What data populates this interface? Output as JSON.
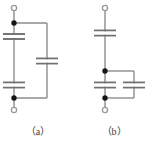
{
  "figure": {
    "type": "circuit-diagram",
    "background_color": "#ffffff",
    "wire_color": "#808080",
    "plate_color": "#7a7a7a",
    "node_color": "#151515",
    "terminal_stroke_color": "#9a9a9a",
    "label_color": "#3b3b3b",
    "panels": [
      {
        "id": "a",
        "caption": "（a）",
        "terminals": [
          {
            "name": "top-terminal",
            "shape": "open-circle",
            "x": 14,
            "y": 8
          },
          {
            "name": "bottom-terminal",
            "shape": "open-circle",
            "x": 14,
            "y": 110
          }
        ],
        "nodes": [
          {
            "name": "top-node",
            "shape": "filled-dot",
            "x": 14,
            "y": 23
          },
          {
            "name": "bottom-node",
            "shape": "filled-dot",
            "x": 14,
            "y": 98
          }
        ],
        "capacitors": [
          {
            "name": "capacitor-top-left",
            "orientation": "horizontal-plates",
            "cx": 14,
            "cy": 36
          },
          {
            "name": "capacitor-bottom-left",
            "orientation": "horizontal-plates",
            "cx": 14,
            "cy": 85
          },
          {
            "name": "capacitor-right-branch",
            "orientation": "horizontal-plates",
            "cx": 47,
            "cy": 61
          }
        ],
        "wires": [
          {
            "name": "wire-top-lead",
            "x1": 14,
            "y1": 8,
            "x2": 14,
            "y2": 23
          },
          {
            "name": "wire-left-rail",
            "x1": 14,
            "y1": 23,
            "x2": 14,
            "y2": 98
          },
          {
            "name": "wire-bottom-lead",
            "x1": 14,
            "y1": 98,
            "x2": 14,
            "y2": 110
          },
          {
            "name": "wire-top-branch",
            "x1": 14,
            "y1": 23,
            "x2": 47,
            "y2": 23
          },
          {
            "name": "wire-right-rail",
            "x1": 47,
            "y1": 23,
            "x2": 47,
            "y2": 98
          },
          {
            "name": "wire-bottom-branch",
            "x1": 14,
            "y1": 98,
            "x2": 47,
            "y2": 98
          }
        ]
      },
      {
        "id": "b",
        "caption": "（b）",
        "terminals": [
          {
            "name": "top-terminal",
            "shape": "open-circle",
            "x": 105,
            "y": 8
          },
          {
            "name": "bottom-terminal",
            "shape": "open-circle",
            "x": 105,
            "y": 110
          }
        ],
        "nodes": [
          {
            "name": "upper-parallel-node",
            "shape": "filled-dot",
            "x": 105,
            "y": 71
          },
          {
            "name": "lower-parallel-node",
            "shape": "filled-dot",
            "x": 105,
            "y": 98
          }
        ],
        "capacitors": [
          {
            "name": "capacitor-series-top",
            "orientation": "horizontal-plates",
            "cx": 105,
            "cy": 33
          },
          {
            "name": "capacitor-parallel-left",
            "orientation": "horizontal-plates",
            "cx": 105,
            "cy": 85
          },
          {
            "name": "capacitor-parallel-right",
            "orientation": "horizontal-plates",
            "cx": 134,
            "cy": 85
          }
        ],
        "wires": [
          {
            "name": "wire-top-lead",
            "x1": 105,
            "y1": 8,
            "x2": 105,
            "y2": 33
          },
          {
            "name": "wire-mid-rail",
            "x1": 105,
            "y1": 33,
            "x2": 105,
            "y2": 71
          },
          {
            "name": "wire-parallel-left-rail",
            "x1": 105,
            "y1": 71,
            "x2": 105,
            "y2": 98
          },
          {
            "name": "wire-bottom-lead",
            "x1": 105,
            "y1": 98,
            "x2": 105,
            "y2": 110
          },
          {
            "name": "wire-parallel-top-branch",
            "x1": 105,
            "y1": 71,
            "x2": 134,
            "y2": 71
          },
          {
            "name": "wire-parallel-right-rail",
            "x1": 134,
            "y1": 71,
            "x2": 134,
            "y2": 98
          },
          {
            "name": "wire-parallel-bottom-branch",
            "x1": 105,
            "y1": 98,
            "x2": 134,
            "y2": 98
          }
        ]
      }
    ]
  }
}
